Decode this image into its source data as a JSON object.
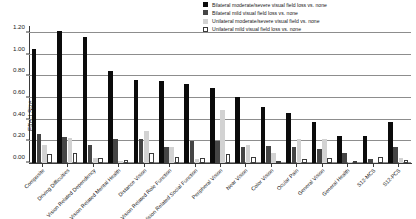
{
  "chart_data": {
    "type": "bar",
    "title": "",
    "xlabel": "",
    "ylabel": "Effect Size",
    "ylim": [
      0.0,
      1.2
    ],
    "ytick_values": [
      0.0,
      0.2,
      0.4,
      0.6,
      0.8,
      1.0,
      1.2
    ],
    "ytick_labels": [
      "0.00",
      "0.20",
      "0.40",
      "0.60",
      "0.80",
      "1.00",
      "1.20"
    ],
    "grid": true,
    "legend_position": "top-right",
    "categories": [
      "Composite",
      "Driving Difficulties",
      "Vision Related Dependency",
      "Vision Related Mental Health",
      "Distance Vision",
      "Vision Related Role Function",
      "Vision Related Social Function",
      "Peripheral Vision",
      "Near Vision",
      "Color Vision",
      "Ocular Pain",
      "General Vision",
      "General Health",
      "S12-MCS",
      "S12-PCS"
    ],
    "series": [
      {
        "name": "Bilateral moderate/severe visual field loss vs. none",
        "color": "#0b0b0b",
        "values": [
          1.05,
          1.22,
          1.16,
          0.85,
          0.77,
          0.76,
          0.73,
          0.69,
          0.61,
          0.52,
          0.46,
          0.38,
          0.25,
          0.25,
          0.38
        ]
      },
      {
        "name": "Bilateral mild visual field loss vs. none",
        "color": "#454545",
        "values": [
          0.27,
          0.24,
          0.17,
          0.22,
          0.22,
          0.15,
          0.2,
          0.2,
          0.15,
          0.16,
          0.15,
          0.13,
          0.09,
          0.04,
          0.15
        ]
      },
      {
        "name": "Unilateral moderate/severe visual field vs. none",
        "color": "#d2d2d2",
        "values": [
          0.17,
          0.23,
          0.05,
          0.02,
          0.3,
          0.15,
          0.04,
          0.49,
          0.17,
          0.09,
          0.22,
          0.22,
          0.01,
          0.01,
          0.05
        ]
      },
      {
        "name": "Unilateral mild visual field loss vs. none",
        "color": "#ffffff",
        "values": [
          0.08,
          0.09,
          0.05,
          0.03,
          0.09,
          0.06,
          0.05,
          0.08,
          0.06,
          0.01,
          0.04,
          0.05,
          0.0,
          0.06,
          0.03
        ]
      }
    ]
  }
}
